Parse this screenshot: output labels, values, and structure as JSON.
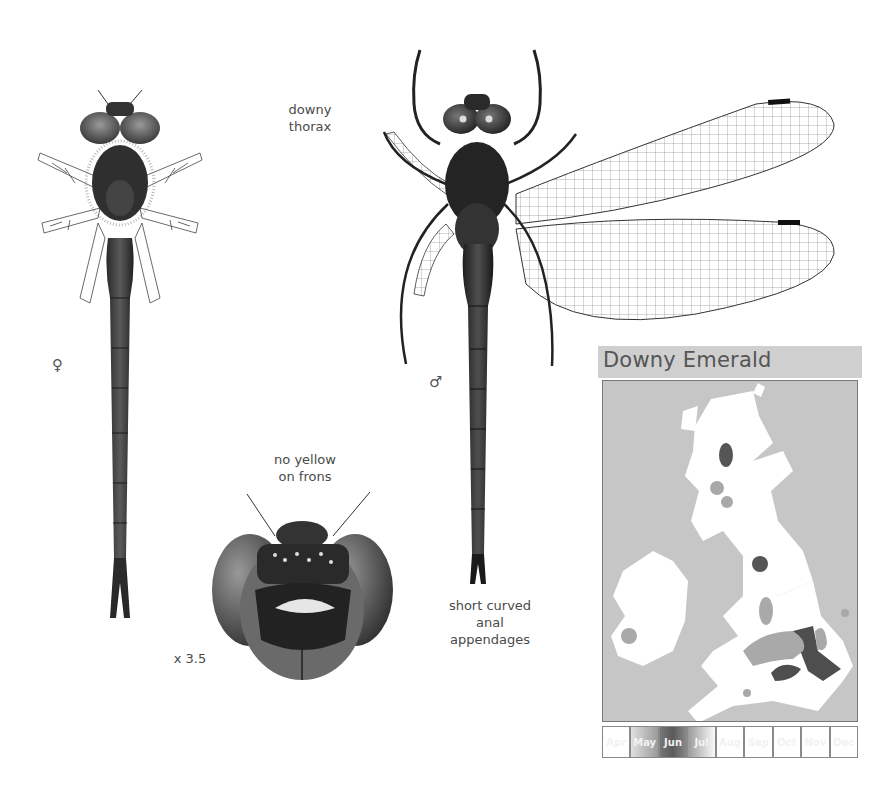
{
  "labels": {
    "downy_thorax": [
      "downy",
      "thorax"
    ],
    "no_yellow_on_frons": [
      "no yellow",
      "on frons"
    ],
    "anal_appendages": [
      "short curved",
      "anal",
      "appendages"
    ],
    "magnification": "x 3.5",
    "female_symbol": "♀",
    "male_symbol": "♂"
  },
  "illustrations": {
    "female": "Downy Emerald female, dorsal view",
    "male": "Downy Emerald male, dorsal view with wings spread",
    "head": "Head, frontal view"
  },
  "map": {
    "title": "Downy Emerald",
    "colors": {
      "sea": "#c6c6c6",
      "land": "#ffffff",
      "range_light": "#a9a9a9",
      "range_dark": "#555555",
      "title_bar": "#cfcfcf"
    },
    "flight_period": {
      "months": [
        "Apr",
        "May",
        "Jun",
        "Jul",
        "Aug",
        "Sep",
        "Oct",
        "Nov",
        "Dec"
      ],
      "highlighted": {
        "May": "medium",
        "Jun": "peak",
        "Jul": "light"
      }
    }
  }
}
